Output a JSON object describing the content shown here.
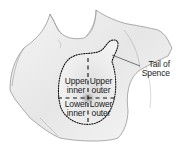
{
  "figure": {
    "type": "anatomical-illustration",
    "quadrants": [
      {
        "line1": "Upper",
        "line2": "inner"
      },
      {
        "line1": "Upper",
        "line2": "outer"
      },
      {
        "line1": "Lower",
        "line2": "inner"
      },
      {
        "line1": "Lower",
        "line2": "outer"
      }
    ],
    "callout": {
      "line1": "Tail of",
      "line2": "Spence"
    }
  }
}
